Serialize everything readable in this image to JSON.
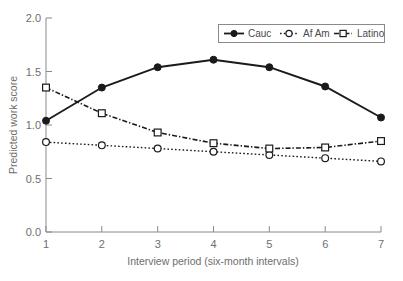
{
  "chart_data": {
    "type": "line",
    "title": "",
    "xlabel": "Interview period (six-month intervals)",
    "ylabel": "Predicted work score",
    "x": [
      1,
      2,
      3,
      4,
      5,
      6,
      7
    ],
    "xticklabels": [
      "1",
      "2",
      "3",
      "4",
      "5",
      "6",
      "7"
    ],
    "yticklabels": [
      "0.0",
      "0.5",
      "1.0",
      "1.5",
      "2.0"
    ],
    "yticks": [
      0.0,
      0.5,
      1.0,
      1.5,
      2.0
    ],
    "xlim": [
      1,
      7
    ],
    "ylim": [
      0.0,
      2.0
    ],
    "grid": false,
    "legend_position": "top-right",
    "series": [
      {
        "name": "Cauc",
        "values": [
          1.04,
          1.35,
          1.54,
          1.61,
          1.54,
          1.36,
          1.07
        ],
        "linestyle": "solid",
        "marker": "filled-circle",
        "color": "#1a1a1a"
      },
      {
        "name": "Af Am",
        "values": [
          0.84,
          0.81,
          0.78,
          0.75,
          0.72,
          0.69,
          0.66
        ],
        "linestyle": "dotted",
        "marker": "open-circle",
        "color": "#1a1a1a"
      },
      {
        "name": "Latino",
        "values": [
          1.35,
          1.11,
          0.93,
          0.83,
          0.78,
          0.79,
          0.85
        ],
        "linestyle": "dash-dot",
        "marker": "open-square",
        "color": "#1a1a1a"
      }
    ]
  },
  "axes": {
    "y_tick_0": "0.0",
    "y_tick_1": "0.5",
    "y_tick_2": "1.0",
    "y_tick_3": "1.5",
    "y_tick_4": "2.0",
    "x_tick_0": "1",
    "x_tick_1": "2",
    "x_tick_2": "3",
    "x_tick_3": "4",
    "x_tick_4": "5",
    "x_tick_5": "6",
    "x_tick_6": "7",
    "x_title": "Interview period (six-month intervals)",
    "y_title": "Predicted work score"
  },
  "legend": {
    "items": [
      {
        "label": "Cauc"
      },
      {
        "label": "Af Am"
      },
      {
        "label": "Latino"
      }
    ]
  }
}
